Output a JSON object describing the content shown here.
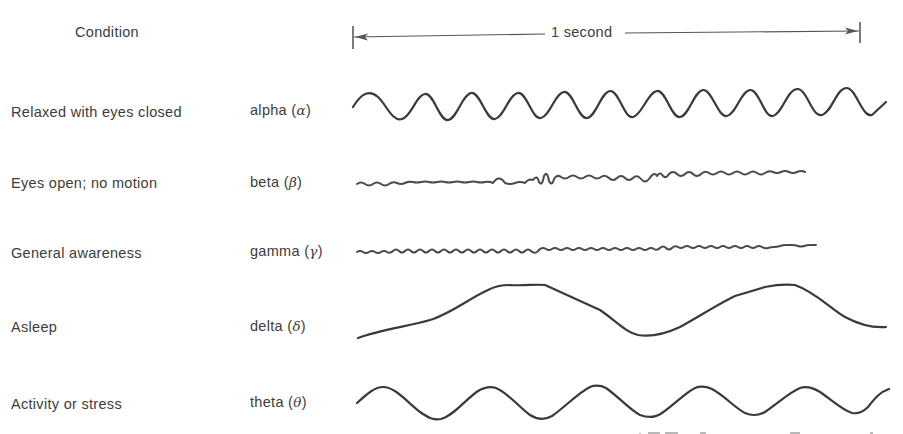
{
  "figure": {
    "header": {
      "condition_label": "Condition",
      "time_scale_label": "1 second"
    },
    "rows": [
      {
        "condition": "Relaxed with eyes closed",
        "band": "alpha",
        "symbol": "α",
        "cycles_per_scale": 10,
        "amplitude": "large",
        "shape": "regular sinusoid"
      },
      {
        "condition": "Eyes open; no motion",
        "band": "beta",
        "symbol": "β",
        "cycles_per_scale": 24,
        "amplitude": "small",
        "shape": "irregular fast low-amplitude"
      },
      {
        "condition": "General awareness",
        "band": "gamma",
        "symbol": "γ",
        "cycles_per_scale": 40,
        "amplitude": "very small",
        "shape": "very fast near-flat ripple"
      },
      {
        "condition": "Asleep",
        "band": "delta",
        "symbol": "δ",
        "cycles_per_scale": 2,
        "amplitude": "very large",
        "shape": "slow broad waves"
      },
      {
        "condition": "Activity or stress",
        "band": "theta",
        "symbol": "θ",
        "cycles_per_scale": 5.5,
        "amplitude": "large",
        "shape": "regular sinusoid"
      }
    ],
    "colors": {
      "ink": "#3a3a3a",
      "background": "#ffffff"
    }
  }
}
